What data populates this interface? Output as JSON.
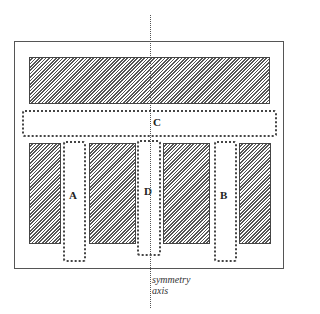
{
  "diagram": {
    "zones": [
      {
        "id": "A",
        "label": "A"
      },
      {
        "id": "B",
        "label": "B"
      },
      {
        "id": "C",
        "label": "C"
      },
      {
        "id": "D",
        "label": "D"
      }
    ],
    "axis_label_line1": "symmetry",
    "axis_label_line2": "axis"
  }
}
